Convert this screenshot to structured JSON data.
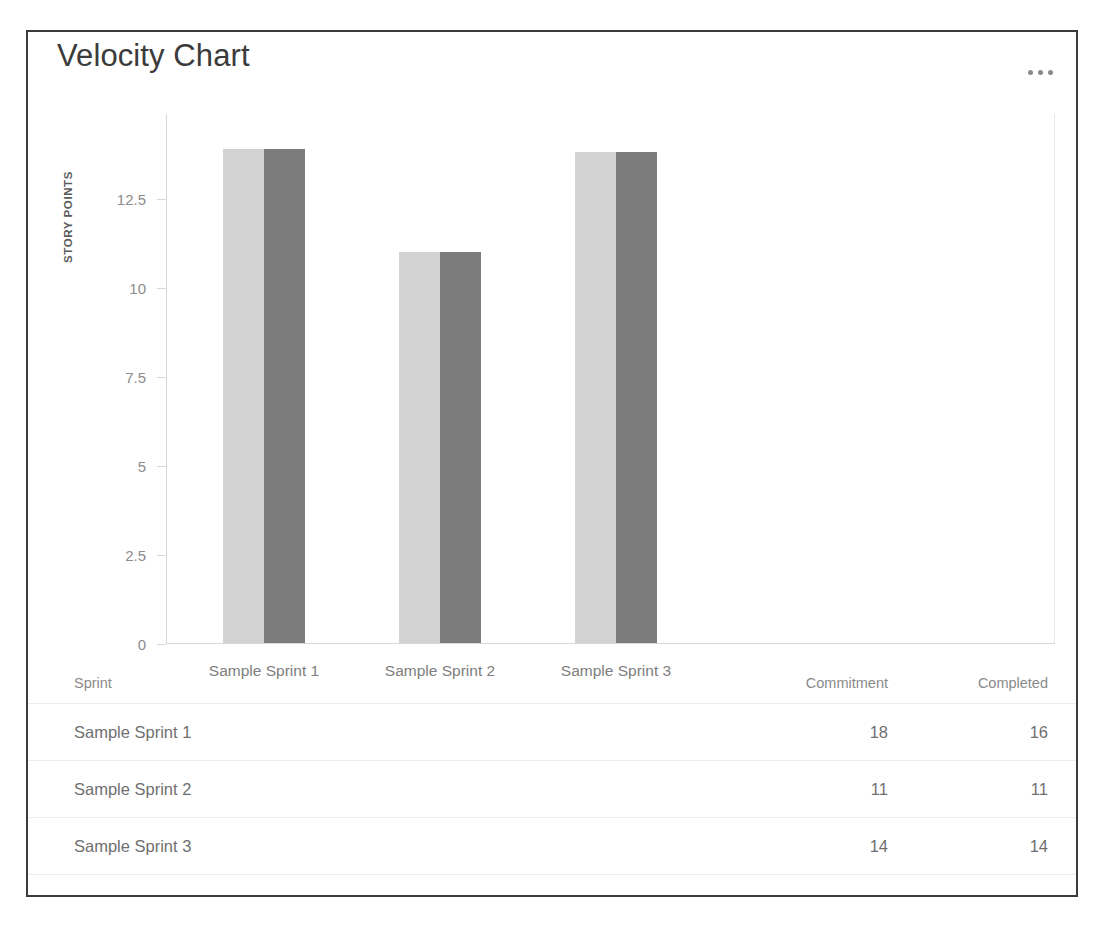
{
  "card": {
    "title": "Velocity Chart",
    "menu_icon": "ellipsis-icon"
  },
  "chart_data": {
    "type": "bar",
    "title": "Velocity Chart",
    "xlabel": "",
    "ylabel": "STORY POINTS",
    "categories": [
      "Sample Sprint 1",
      "Sample Sprint 2",
      "Sample Sprint 3"
    ],
    "series": [
      {
        "name": "Commitment",
        "values": [
          18,
          11,
          14
        ],
        "color": "#d2d2d2"
      },
      {
        "name": "Completed",
        "values": [
          16,
          11,
          14
        ],
        "color": "#7c7c7c"
      }
    ],
    "ytick_labels": [
      "12.5",
      "10",
      "7.5",
      "5",
      "2.5",
      "0"
    ],
    "ytick_values": [
      12.5,
      10,
      7.5,
      5,
      2.5,
      0
    ],
    "ylim": [
      0,
      14.9
    ],
    "grid": false,
    "legend": "none",
    "plotted_heights": [
      {
        "category": "Sample Sprint 1",
        "commitment": 13.9,
        "completed": 13.9
      },
      {
        "category": "Sample Sprint 2",
        "commitment": 11.0,
        "completed": 11.0
      },
      {
        "category": "Sample Sprint 3",
        "commitment": 13.8,
        "completed": 13.8
      }
    ]
  },
  "table": {
    "headers": {
      "sprint": "Sprint",
      "commitment": "Commitment",
      "completed": "Completed"
    },
    "rows": [
      {
        "sprint": "Sample Sprint 1",
        "commitment": "18",
        "completed": "16"
      },
      {
        "sprint": "Sample Sprint 2",
        "commitment": "11",
        "completed": "11"
      },
      {
        "sprint": "Sample Sprint 3",
        "commitment": "14",
        "completed": "14"
      }
    ]
  }
}
